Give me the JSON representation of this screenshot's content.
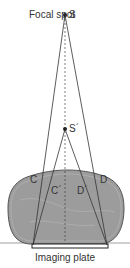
{
  "labels": {
    "focal_spot": "Focal spot",
    "source": "S",
    "source_prime": "S´",
    "c": "C",
    "d": "D",
    "c_prime": "C´",
    "d_prime": "D´",
    "imaging_plate": "Imaging plate"
  },
  "colors": {
    "object_fill": "#9a9a9a",
    "object_stroke": "#555555",
    "ray": "#333333",
    "plate": "#ffffff",
    "plate_stroke": "#222222"
  }
}
